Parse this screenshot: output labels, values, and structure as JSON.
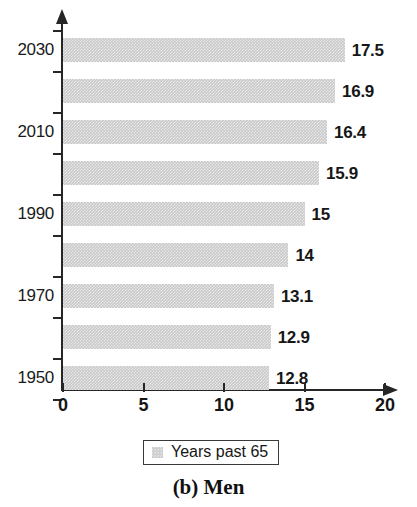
{
  "chart_data": {
    "type": "bar",
    "orientation": "horizontal",
    "title": "",
    "caption": "(b) Men",
    "xlabel": "",
    "ylabel": "",
    "xlim": [
      0,
      20
    ],
    "xticks": [
      0,
      5,
      10,
      15,
      20
    ],
    "xtick_labels": [
      "0",
      "5",
      "10",
      "15",
      "20"
    ],
    "grid": false,
    "legend": {
      "position": "bottom-center",
      "entries": [
        {
          "label": "Years past 65",
          "color": "#c9c9c9"
        }
      ]
    },
    "categories": [
      "2030",
      "",
      "2010",
      "",
      "1990",
      "",
      "1970",
      "",
      "1950"
    ],
    "ytick_labels": [
      "2030",
      "",
      "2010",
      "",
      "1990",
      "",
      "1970",
      "",
      "1950"
    ],
    "values": [
      17.5,
      16.9,
      16.4,
      15.9,
      15,
      14,
      13.1,
      12.9,
      12.8
    ],
    "value_labels": [
      "17.5",
      "16.9",
      "16.4",
      "15.9",
      "15",
      "14",
      "13.1",
      "12.9",
      "12.8"
    ],
    "series": [
      {
        "name": "Years past 65",
        "values": [
          17.5,
          16.9,
          16.4,
          15.9,
          15,
          14,
          13.1,
          12.9,
          12.8
        ]
      }
    ],
    "bars": [
      {
        "category": "2030",
        "value": 17.5,
        "label": "17.5"
      },
      {
        "category": "",
        "value": 16.9,
        "label": "16.9"
      },
      {
        "category": "2010",
        "value": 16.4,
        "label": "16.4"
      },
      {
        "category": "",
        "value": 15.9,
        "label": "15.9"
      },
      {
        "category": "1990",
        "value": 15,
        "label": "15"
      },
      {
        "category": "",
        "value": 14,
        "label": "14"
      },
      {
        "category": "1970",
        "value": 13.1,
        "label": "13.1"
      },
      {
        "category": "",
        "value": 12.9,
        "label": "12.9"
      },
      {
        "category": "1950",
        "value": 12.8,
        "label": "12.8"
      }
    ],
    "colors": {
      "bar": "#c9c9c9",
      "axis": "#262626",
      "text": "#161616",
      "background": "#ffffff"
    }
  }
}
